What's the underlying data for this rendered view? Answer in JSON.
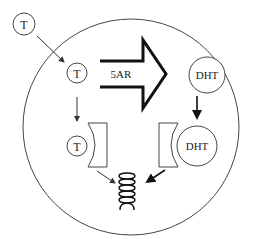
{
  "diagram": {
    "labels": {
      "t_outside": "T",
      "t_inside": "T",
      "t_bound": "T",
      "enzyme": "5AR",
      "dht_free": "DHT",
      "dht_bound": "DHT"
    },
    "colors": {
      "stroke": "#333333",
      "background": "#ffffff"
    }
  }
}
